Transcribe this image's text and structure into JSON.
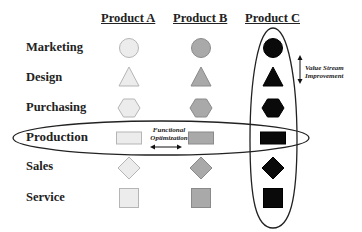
{
  "headers": [
    "Product A",
    "Product B",
    "Product C"
  ],
  "rows": [
    {
      "label": "Marketing",
      "shape": "circle"
    },
    {
      "label": "Design",
      "shape": "triangle"
    },
    {
      "label": "Purchasing",
      "shape": "hexagon"
    },
    {
      "label": "Production",
      "shape": "rectangle"
    },
    {
      "label": "Sales",
      "shape": "diamond"
    },
    {
      "label": "Service",
      "shape": "square"
    }
  ],
  "product_fills": {
    "Product A": "#ececec",
    "Product B": "#a9a9a9",
    "Product C": "#0a0a0a"
  },
  "product_strokes": {
    "Product A": "#b5b5b5",
    "Product B": "#8a8a8a",
    "Product C": "#000000"
  },
  "annotations": {
    "value_stream_line1": "Value Stream",
    "value_stream_line2": "Improvement",
    "functional_line1": "Functional",
    "functional_line2": "Optimization"
  },
  "highlight_row": "Production",
  "highlight_column": "Product C"
}
